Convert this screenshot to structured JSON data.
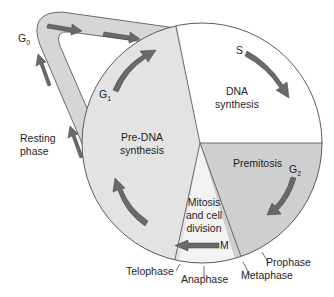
{
  "diagram": {
    "colors": {
      "background": "#ffffff",
      "pre_dna_fill": "#e3e3e3",
      "dna_fill": "#ffffff",
      "premitosis_fill": "#cfcfcf",
      "mitosis_fill": "#f3f3f3",
      "loop_fill": "#d6d6d6",
      "arrow_fill": "#6a6a6a",
      "outline": "#4a4a4a",
      "text": "#1e1e1e"
    },
    "phases": [
      {
        "id": "g0",
        "letter": "G",
        "sub": "0",
        "name": "Resting phase",
        "name_lines": [
          "Resting",
          "phase"
        ]
      },
      {
        "id": "g1",
        "letter": "G",
        "sub": "1",
        "name": "Pre-DNA synthesis",
        "name_lines": [
          "Pre-DNA",
          "synthesis"
        ]
      },
      {
        "id": "s",
        "letter": "S",
        "sub": "",
        "name": "DNA synthesis",
        "name_lines": [
          "DNA",
          "synthesis"
        ]
      },
      {
        "id": "g2",
        "letter": "G",
        "sub": "2",
        "name": "Premitosis",
        "name_lines": [
          "Premitosis"
        ]
      },
      {
        "id": "m",
        "letter": "M",
        "sub": "",
        "name": "Mitosis and cell division",
        "name_lines": [
          "Mitosis",
          "and cell",
          "division"
        ]
      }
    ],
    "mitosis_stages": [
      "Prophase",
      "Metaphase",
      "Anaphase",
      "Telophase"
    ]
  }
}
